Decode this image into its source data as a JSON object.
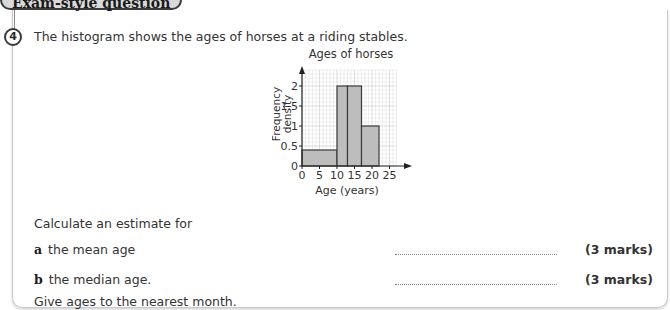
{
  "header": {
    "label": "Exam-style question"
  },
  "question": {
    "number": "4",
    "intro": "The histogram shows the ages of horses at a riding stables.",
    "prompt": "Calculate an estimate for",
    "parts": [
      {
        "letter": "a",
        "text": "the mean age",
        "marks": "(3 marks)"
      },
      {
        "letter": "b",
        "text": "the median age.",
        "marks": "(3 marks)"
      }
    ],
    "instruction": "Give ages to the nearest month."
  },
  "chart_data": {
    "type": "bar",
    "title": "Ages of horses",
    "xlabel": "Age (years)",
    "ylabel": "Frequency density",
    "x_ticks": [
      "0",
      "5",
      "10",
      "15",
      "20",
      "25"
    ],
    "y_ticks": [
      "0",
      "0.5",
      "1",
      "1.5",
      "2"
    ],
    "xlim": [
      0,
      27
    ],
    "ylim": [
      0,
      2.4
    ],
    "grid": true,
    "bins": [
      {
        "from": 0,
        "to": 10,
        "frequency_density": 0.4
      },
      {
        "from": 10,
        "to": 13,
        "frequency_density": 2
      },
      {
        "from": 13,
        "to": 17,
        "frequency_density": 2
      },
      {
        "from": 17,
        "to": 22,
        "frequency_density": 1
      }
    ],
    "colors": {
      "bar_fill": "#bdbdbd",
      "bar_edge": "#3a3a3a",
      "grid": "#d6d6d6"
    }
  }
}
